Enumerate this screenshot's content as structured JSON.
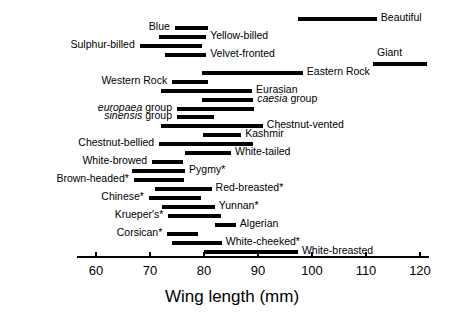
{
  "chart_data": {
    "type": "bar",
    "orientation": "horizontal",
    "subtype": "range-bar",
    "title": "",
    "xlabel": "Wing length (mm)",
    "ylabel": "",
    "xlim": [
      57,
      122.5
    ],
    "xticks": [
      60,
      70,
      80,
      90,
      100,
      110,
      120
    ],
    "xtick_labels": [
      "60",
      "70",
      "80",
      "90",
      "100",
      "110",
      "120"
    ],
    "grid": false,
    "legend": null,
    "note": "Each horizontal bar spans the minimum to maximum wing length for one taxon; taxon name is printed at the left or right end of its bar. Names in italics are species groups; an asterisk marks certain taxa.",
    "categories": [
      "Beautiful",
      "Blue",
      "Yellow-billed",
      "Sulphur-billed",
      "Velvet-fronted",
      "Giant",
      "Eastern Rock",
      "Western Rock",
      "Eurasian",
      "caesia group",
      "europaea group",
      "sinensis group",
      "Chestnut-vented",
      "Kashmir",
      "Chestnut-bellied",
      "White-tailed",
      "White-browed",
      "Pygmy*",
      "Brown-headed*",
      "Red-breasted*",
      "Chinese*",
      "Yunnan*",
      "Krueper's*",
      "Algerian",
      "Corsican*",
      "White-cheeked*",
      "White-breasted"
    ],
    "ranges": [
      {
        "label": "Beautiful",
        "min": 97.4,
        "max": 112.0,
        "label_side": "right",
        "italic": false
      },
      {
        "label": "Blue",
        "min": 74.6,
        "max": 80.7,
        "label_side": "left",
        "italic": false
      },
      {
        "label": "Yellow-billed",
        "min": 71.7,
        "max": 80.4,
        "label_side": "right",
        "italic": false
      },
      {
        "label": "Sulphur-billed",
        "min": 68.1,
        "max": 79.6,
        "label_side": "left",
        "italic": false
      },
      {
        "label": "Velvet-fronted",
        "min": 72.8,
        "max": 80.4,
        "label_side": "right",
        "italic": false
      },
      {
        "label": "Giant",
        "min": 111.3,
        "max": 121.3,
        "label_side": "right-above",
        "italic": false
      },
      {
        "label": "Eastern Rock",
        "min": 79.6,
        "max": 98.3,
        "label_side": "right",
        "italic": false
      },
      {
        "label": "Western Rock",
        "min": 74.1,
        "max": 80.7,
        "label_side": "left",
        "italic": false
      },
      {
        "label": "Eurasian",
        "min": 72.1,
        "max": 88.9,
        "label_side": "right",
        "italic": false
      },
      {
        "label": "caesia group",
        "min": 79.6,
        "max": 89.1,
        "label_side": "right",
        "italic": true
      },
      {
        "label": "europaea group",
        "min": 75.0,
        "max": 89.3,
        "label_side": "left",
        "italic": true
      },
      {
        "label": "sinensis group",
        "min": 75.0,
        "max": 81.8,
        "label_side": "left",
        "italic": true
      },
      {
        "label": "Chestnut-vented",
        "min": 72.1,
        "max": 90.9,
        "label_side": "right",
        "italic": false
      },
      {
        "label": "Kashmir",
        "min": 79.8,
        "max": 86.9,
        "label_side": "right",
        "italic": false
      },
      {
        "label": "Chestnut-bellied",
        "min": 71.7,
        "max": 89.1,
        "label_side": "left",
        "italic": false
      },
      {
        "label": "White-tailed",
        "min": 76.5,
        "max": 85.0,
        "label_side": "right",
        "italic": false
      },
      {
        "label": "White-browed",
        "min": 70.4,
        "max": 76.1,
        "label_side": "left",
        "italic": false
      },
      {
        "label": "Pygmy*",
        "min": 66.7,
        "max": 76.5,
        "label_side": "right",
        "italic": false
      },
      {
        "label": "Brown-headed*",
        "min": 67.0,
        "max": 76.3,
        "label_side": "left",
        "italic": false
      },
      {
        "label": "Red-breasted*",
        "min": 70.9,
        "max": 81.4,
        "label_side": "right",
        "italic": false
      },
      {
        "label": "Chinese*",
        "min": 69.8,
        "max": 79.4,
        "label_side": "left",
        "italic": false
      },
      {
        "label": "Yunnan*",
        "min": 72.3,
        "max": 82.0,
        "label_side": "right",
        "italic": false
      },
      {
        "label": "Krueper's*",
        "min": 73.4,
        "max": 83.1,
        "label_side": "left",
        "italic": false
      },
      {
        "label": "Algerian",
        "min": 82.0,
        "max": 85.9,
        "label_side": "right",
        "italic": false
      },
      {
        "label": "Corsican*",
        "min": 73.2,
        "max": 78.9,
        "label_side": "left",
        "italic": false
      },
      {
        "label": "White-cheeked*",
        "min": 74.1,
        "max": 83.3,
        "label_side": "right",
        "italic": false
      },
      {
        "label": "White-breasted",
        "min": 80.0,
        "max": 97.4,
        "label_side": "right",
        "italic": false
      }
    ]
  },
  "axis": {
    "title": "Wing length (mm)",
    "ticks": [
      "60",
      "70",
      "80",
      "90",
      "100",
      "110",
      "120"
    ]
  },
  "colors": {
    "bar": "#000000",
    "axis": "#000000",
    "background": "#ffffff",
    "text": "#000000"
  }
}
